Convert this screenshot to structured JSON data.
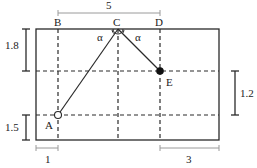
{
  "diagram": {
    "points": {
      "A": {
        "label": "A",
        "x": 58,
        "y": 115
      },
      "B": {
        "label": "B",
        "x": 58,
        "y": 29
      },
      "C": {
        "label": "C",
        "x": 118,
        "y": 29
      },
      "D": {
        "label": "D",
        "x": 160,
        "y": 29
      },
      "E": {
        "label": "E",
        "x": 160,
        "y": 71
      }
    },
    "angles": {
      "left": "α",
      "right": "α"
    },
    "dimensions": {
      "top_BD": "5",
      "left_upper": "1.8",
      "left_lower": "1.5",
      "right_middle": "1.2",
      "bottom_left": "1",
      "bottom_right": "3"
    },
    "colors": {
      "line": "#2a2a2a",
      "dim": "#9a9a9a"
    }
  }
}
